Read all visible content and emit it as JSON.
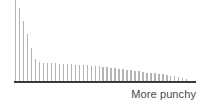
{
  "chart_data": {
    "type": "bar",
    "title": "",
    "subtitle": "",
    "xlabel": "More punchy",
    "ylabel": "",
    "grid": false,
    "legend": null,
    "axis_color": "#3a3a3a",
    "bar_color": "#b4b4b4",
    "background": "#ffffff",
    "xlim": [
      0,
      44
    ],
    "ylim": [
      0,
      86
    ],
    "x_axis_visible": true,
    "y_axis_visible": false,
    "tick_labels_x": [],
    "tick_labels_y": [],
    "annotations": [],
    "categories": [
      "1",
      "2",
      "3",
      "4",
      "5",
      "6",
      "7",
      "8",
      "9",
      "10",
      "11",
      "12",
      "13",
      "14",
      "15",
      "16",
      "17",
      "18",
      "19",
      "20",
      "21",
      "22",
      "23",
      "24",
      "25",
      "26",
      "27",
      "28",
      "29",
      "30",
      "31",
      "32",
      "33",
      "34",
      "35",
      "36",
      "37",
      "38",
      "39",
      "40",
      "41",
      "42",
      "43",
      "44"
    ],
    "values": [
      86,
      77,
      64,
      50,
      35,
      23,
      20,
      19,
      19,
      19,
      19,
      18,
      18,
      18,
      18,
      17,
      17,
      17,
      17,
      16,
      16,
      16,
      15,
      15,
      14,
      14,
      13,
      13,
      12,
      12,
      11,
      11,
      10,
      9,
      9,
      8,
      7,
      7,
      6,
      5,
      5,
      4,
      3,
      2
    ]
  },
  "chart": {
    "plot_left": 15,
    "plot_right": 186,
    "baseline_y": 81,
    "plot_top": 0,
    "bar_width": 1.4
  },
  "labels": {
    "x_axis_caption": "More punchy"
  }
}
